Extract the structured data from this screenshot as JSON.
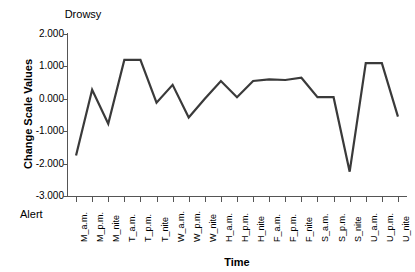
{
  "chart_data": {
    "type": "line",
    "title": "",
    "xlabel": "Time",
    "ylabel": "Change Scale Values",
    "top_anchor_label": "Drowsy",
    "bottom_anchor_label": "Alert",
    "ylim": [
      -3.0,
      2.0
    ],
    "ytick_labels": [
      "2.000",
      "1.000",
      "0.000",
      "-1.000",
      "-2.000",
      "-3.000"
    ],
    "ytick_values": [
      2.0,
      1.0,
      0.0,
      -1.0,
      -2.0,
      -3.0
    ],
    "grid": false,
    "legend": "none",
    "line_color": "#3a3a3a",
    "categories": [
      "M_a.m.",
      "M_p.m.",
      "M_nite",
      "T_a.m.",
      "T_p.m.",
      "T_nite",
      "W_a.m.",
      "W_p.m.",
      "W_nite",
      "H_a.m.",
      "H_p.m.",
      "H_nite",
      "F_a.m.",
      "F_p.m.",
      "F_nite",
      "S_a.m.",
      "S_p.m.",
      "S_nite",
      "U_a.m.",
      "U_p.m.",
      "U_nite"
    ],
    "values": [
      -1.75,
      0.28,
      -0.77,
      1.2,
      1.2,
      -0.12,
      0.43,
      -0.58,
      0.0,
      0.55,
      0.05,
      0.55,
      0.6,
      0.58,
      0.65,
      0.05,
      0.05,
      -2.25,
      1.1,
      1.1,
      -0.55
    ],
    "series": [
      {
        "name": "Change Scale Values",
        "values": [
          -1.75,
          0.28,
          -0.77,
          1.2,
          1.2,
          -0.12,
          0.43,
          -0.58,
          0.0,
          0.55,
          0.05,
          0.55,
          0.6,
          0.58,
          0.65,
          0.05,
          0.05,
          -2.25,
          1.1,
          1.1,
          -0.55
        ]
      }
    ]
  }
}
